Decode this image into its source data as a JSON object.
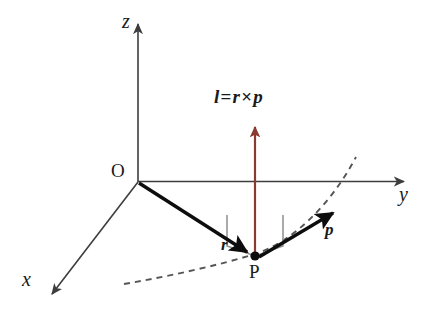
{
  "figure": {
    "background_color": "#ffffff",
    "width": 440,
    "height": 322
  },
  "colors": {
    "axis": "#3d3d3d",
    "vector": "#0d0d0d",
    "angular_momentum": "#8b3a32",
    "trajectory": "#555555",
    "right_angle_marker": "#888888",
    "text": "#1a1a1a"
  },
  "axes": [
    {
      "id": "z-axis",
      "label": "z",
      "direction": "up",
      "label_x": 122,
      "label_y": 14
    },
    {
      "id": "y-axis",
      "label": "y",
      "direction": "right",
      "label_x": 399,
      "label_y": 185
    },
    {
      "id": "x-axis",
      "label": "x",
      "direction": "down-left",
      "label_x": 22,
      "label_y": 272
    }
  ],
  "points": [
    {
      "id": "origin",
      "label": "O",
      "label_x": 113,
      "label_y": 163,
      "x": 138,
      "y": 182,
      "dot": false
    },
    {
      "id": "particle",
      "label": "P",
      "label_x": 248,
      "label_y": 262,
      "x": 255,
      "y": 257,
      "dot": true
    }
  ],
  "vectors": [
    {
      "id": "position-vector",
      "label": "r",
      "symbol": "r",
      "description": "position vector from origin O to particle P",
      "color": "#0d0d0d",
      "from": {
        "x": 138,
        "y": 182
      },
      "to": {
        "x": 252,
        "y": 255
      },
      "label_x": 222,
      "label_y": 238
    },
    {
      "id": "momentum-vector",
      "label": "p",
      "symbol": "p",
      "description": "linear momentum of the particle, tangent to trajectory",
      "color": "#0d0d0d",
      "from": {
        "x": 258,
        "y": 256
      },
      "to": {
        "x": 337,
        "y": 210
      },
      "label_x": 325,
      "label_y": 222
    },
    {
      "id": "angular-momentum-vector",
      "label": "l",
      "symbol": "l",
      "description": "angular momentum vector, perpendicular to plane of r and p",
      "color": "#8b3a32",
      "from": {
        "x": 255,
        "y": 256
      },
      "to": {
        "x": 255,
        "y": 124
      },
      "label_x": 215,
      "label_y": 96
    }
  ],
  "equation": {
    "id": "angular-momentum-equation",
    "lhs": "l",
    "equals": "=",
    "rhs_first": "r",
    "cross": "×",
    "rhs_second": "p",
    "plain_text": "l = r × p",
    "x": 215,
    "y": 93
  },
  "trajectory": {
    "id": "particle-trajectory",
    "style": "dashed",
    "description": "dashed curved path of the particle passing through P",
    "color": "#555555"
  },
  "markers": [
    {
      "id": "perpendicular-marker",
      "type": "right-angle-double",
      "description": "double right-angle (open book) marker showing l is perpendicular to the r-p plane",
      "color": "#888888"
    }
  ]
}
